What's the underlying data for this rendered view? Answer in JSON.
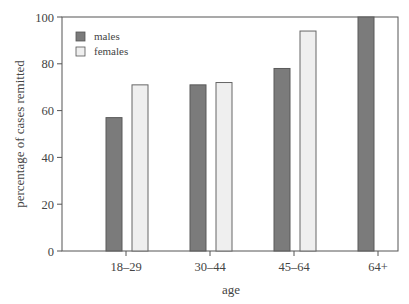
{
  "chart_data": {
    "type": "bar",
    "title": "",
    "xlabel": "age",
    "ylabel": "percentage of cases remitted",
    "categories": [
      "18–29",
      "30–44",
      "45–64",
      "64+"
    ],
    "series": [
      {
        "name": "males",
        "color": "#7b7b7b",
        "values": [
          57,
          71,
          78,
          100
        ]
      },
      {
        "name": "females",
        "color": "#efefef",
        "values": [
          71,
          72,
          94,
          null
        ]
      }
    ],
    "ylim": [
      0,
      100
    ],
    "yticks": [
      0,
      20,
      40,
      60,
      80,
      100
    ],
    "grid": false,
    "legend_position": "upper left"
  },
  "legend": {
    "males": "males",
    "females": "females"
  },
  "axes": {
    "xlabel": "age",
    "ylabel": "percentage of cases remitted"
  }
}
